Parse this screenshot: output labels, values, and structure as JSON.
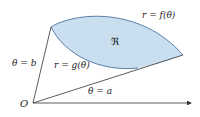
{
  "diagram": {
    "labels": {
      "upper_curve": "r = f(θ)",
      "lower_curve": "r = g(θ)",
      "ray_b": "θ = b",
      "ray_a": "θ = a",
      "origin": "O",
      "region": "ℜ"
    },
    "colors": {
      "region_fill": "#c9dff0",
      "curve_stroke": "#5b7fa6",
      "ray_stroke": "#333333",
      "text": "#222222"
    }
  }
}
